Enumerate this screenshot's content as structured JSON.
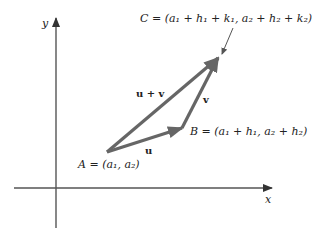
{
  "axes": {
    "x_label": "x",
    "y_label": "y",
    "color": "#555555"
  },
  "vectors": {
    "color": "#666666",
    "u": {
      "label": "u",
      "from": "A",
      "to": "B"
    },
    "v": {
      "label": "v",
      "from": "B",
      "to": "C"
    },
    "sum": {
      "label": "u + v",
      "from": "A",
      "to": "C"
    }
  },
  "points": {
    "A": {
      "name": "A",
      "label": "A = (a₁, a₂)"
    },
    "B": {
      "name": "B",
      "label": "B = (a₁ + h₁, a₂ + h₂)"
    },
    "C": {
      "name": "C",
      "label": "C = (a₁ + h₁ + k₁, a₂ + h₂ + k₂)"
    }
  }
}
